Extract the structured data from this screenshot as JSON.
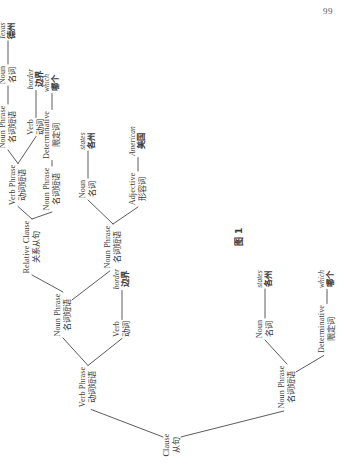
{
  "page": {
    "number": "99"
  },
  "figure": {
    "caption": "图 1",
    "nodes": [
      {
        "id": "clause",
        "en": "Clause",
        "zh": "从句",
        "x": 30,
        "y": 172,
        "leaf": false
      },
      {
        "id": "np1",
        "en": "Noun Phrase",
        "zh": "名词短语",
        "x": 88,
        "y": 287,
        "leaf": false
      },
      {
        "id": "vp1",
        "en": "Verb Phrase",
        "zh": "动词短语",
        "x": 88,
        "y": 88,
        "leaf": false
      },
      {
        "id": "det1",
        "en": "Determinative",
        "zh": "限定词",
        "x": 146,
        "y": 327,
        "leaf": false
      },
      {
        "id": "det1-word",
        "en": "which",
        "zh": "哪个",
        "x": 196,
        "y": 327,
        "leaf": true
      },
      {
        "id": "noun1",
        "en": "Noun",
        "zh": "名词",
        "x": 146,
        "y": 265,
        "leaf": false
      },
      {
        "id": "noun1-word",
        "en": "states",
        "zh": "各州",
        "x": 196,
        "y": 265,
        "leaf": true
      },
      {
        "id": "verb1",
        "en": "Verb",
        "zh": "动词",
        "x": 146,
        "y": 122,
        "leaf": false
      },
      {
        "id": "verb1-word",
        "en": "border",
        "zh": "边界",
        "x": 196,
        "y": 122,
        "leaf": true
      },
      {
        "id": "np2",
        "en": "Noun Phrase",
        "zh": "名词短语",
        "x": 160,
        "y": 63,
        "leaf": false
      },
      {
        "id": "np3",
        "en": "Noun Phrase",
        "zh": "名词短语",
        "x": 228,
        "y": 113,
        "leaf": false
      },
      {
        "id": "relclause",
        "en": "Relative Clause",
        "zh": "关系从句",
        "x": 228,
        "y": 32,
        "leaf": false
      },
      {
        "id": "adj1",
        "en": "Adjective",
        "zh": "形容词",
        "x": 286,
        "y": 138,
        "leaf": false
      },
      {
        "id": "adj1-word",
        "en": "American",
        "zh": "美国",
        "x": 334,
        "y": 138,
        "leaf": true
      },
      {
        "id": "noun2",
        "en": "Noun",
        "zh": "名词",
        "x": 286,
        "y": 88,
        "leaf": false
      },
      {
        "id": "noun2-word",
        "en": "states",
        "zh": "各州",
        "x": 334,
        "y": 88,
        "leaf": true
      },
      {
        "id": "np4",
        "en": "Noun Phrase",
        "zh": "名词短语",
        "x": 286,
        "y": 52,
        "leaf": false
      },
      {
        "id": "det2",
        "en": "Determinative",
        "zh": "限定词",
        "x": 340,
        "y": 52,
        "leaf": false
      },
      {
        "id": "det2-word",
        "en": "which",
        "zh": "哪个",
        "x": 392,
        "y": 52,
        "leaf": true
      },
      {
        "id": "vp2",
        "en": "Verb Phrase",
        "zh": "动词短语",
        "x": 290,
        "y": 18,
        "leaf": false
      },
      {
        "id": "verb2",
        "en": "Verb",
        "zh": "动词",
        "x": 348,
        "y": 36,
        "leaf": false
      },
      {
        "id": "verb2-word",
        "en": "border",
        "zh": "边界",
        "x": 396,
        "y": 36,
        "leaf": true
      },
      {
        "id": "np5",
        "en": "Noun Phrase",
        "zh": "名词短语",
        "x": 348,
        "y": 8,
        "leaf": false
      },
      {
        "id": "noun3",
        "en": "Noun",
        "zh": "名词",
        "x": 400,
        "y": 8,
        "leaf": false
      },
      {
        "id": "noun3-word",
        "en": "Texas",
        "zh": "德州",
        "x": 444,
        "y": 8,
        "leaf": true
      }
    ],
    "edges": [
      {
        "from": "clause",
        "to": "np1"
      },
      {
        "from": "clause",
        "to": "vp1"
      },
      {
        "from": "np1",
        "to": "det1"
      },
      {
        "from": "np1",
        "to": "noun1"
      },
      {
        "from": "det1",
        "to": "det1-word"
      },
      {
        "from": "noun1",
        "to": "noun1-word"
      },
      {
        "from": "vp1",
        "to": "verb1"
      },
      {
        "from": "vp1",
        "to": "np2"
      },
      {
        "from": "verb1",
        "to": "verb1-word"
      },
      {
        "from": "np2",
        "to": "np3"
      },
      {
        "from": "np2",
        "to": "relclause"
      },
      {
        "from": "np3",
        "to": "adj1"
      },
      {
        "from": "np3",
        "to": "noun2"
      },
      {
        "from": "adj1",
        "to": "adj1-word"
      },
      {
        "from": "noun2",
        "to": "noun2-word"
      },
      {
        "from": "relclause",
        "to": "np4"
      },
      {
        "from": "relclause",
        "to": "vp2"
      },
      {
        "from": "np4",
        "to": "det2"
      },
      {
        "from": "det2",
        "to": "det2-word"
      },
      {
        "from": "vp2",
        "to": "verb2"
      },
      {
        "from": "vp2",
        "to": "np5"
      },
      {
        "from": "verb2",
        "to": "verb2-word"
      },
      {
        "from": "np5",
        "to": "noun3"
      },
      {
        "from": "noun3",
        "to": "noun3-word"
      }
    ],
    "caption_pos": {
      "x": 238,
      "y": 238
    }
  },
  "colors": {
    "background": "#ffffff",
    "ink": "#3b3b3b",
    "line": "#4a4a4a",
    "page_number": "#5a5a5a"
  }
}
